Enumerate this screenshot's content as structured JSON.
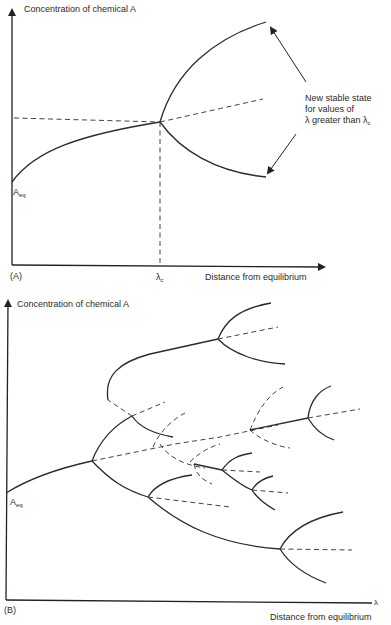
{
  "panel_a": {
    "panel_label": "(A)",
    "y_axis_label": "Concentration of chemical A",
    "x_axis_label": "Distance from equilibrium",
    "start_label_main": "A",
    "start_label_sub": "eq",
    "critical_label_main": "λ",
    "critical_label_sub": "c",
    "annotation": {
      "line1": "New stable state",
      "line2": "for values of",
      "line3_main": "λ greater than λ",
      "line3_sub": "c"
    }
  },
  "panel_b": {
    "panel_label": "(B)",
    "y_axis_label": "Concentration of chemical A",
    "x_axis_label": "Distance from equilibrium",
    "x_axis_symbol": "λ",
    "start_label_main": "A",
    "start_label_sub": "eq"
  },
  "colors": {
    "line": "#2b2b2b",
    "background": "#ffffff"
  }
}
